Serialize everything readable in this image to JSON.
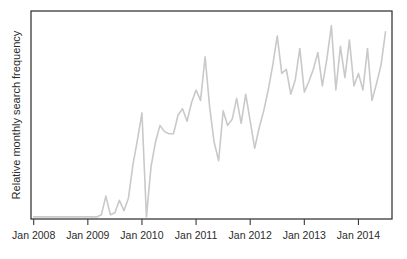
{
  "chart_data": {
    "type": "line",
    "title": "",
    "xlabel": "",
    "ylabel": "Relative monthly search frequency",
    "grid": false,
    "legend": false,
    "x_tick_labels": [
      "Jan 2008",
      "Jan 2009",
      "Jan 2010",
      "Jan 2011",
      "Jan 2012",
      "Jan 2013",
      "Jan 2014"
    ],
    "x_tick_values": [
      2008.0,
      2009.0,
      2010.0,
      2011.0,
      2012.0,
      2013.0,
      2014.0
    ],
    "xlim": [
      2007.95,
      2014.62
    ],
    "ylim": [
      0,
      100
    ],
    "y_tick_labels": [],
    "line_color": "#c9c9c9",
    "frame_color": "#3a3a3a",
    "background_color": "#ffffff",
    "series": [
      {
        "name": "Relative monthly search frequency",
        "x": [
          2008.0,
          2008.083,
          2008.167,
          2008.25,
          2008.333,
          2008.417,
          2008.5,
          2008.583,
          2008.667,
          2008.75,
          2008.833,
          2008.917,
          2009.0,
          2009.083,
          2009.167,
          2009.25,
          2009.333,
          2009.417,
          2009.5,
          2009.583,
          2009.667,
          2009.75,
          2009.833,
          2009.917,
          2010.0,
          2010.083,
          2010.167,
          2010.25,
          2010.333,
          2010.417,
          2010.5,
          2010.583,
          2010.667,
          2010.75,
          2010.833,
          2010.917,
          2011.0,
          2011.083,
          2011.167,
          2011.25,
          2011.333,
          2011.417,
          2011.5,
          2011.583,
          2011.667,
          2011.75,
          2011.833,
          2011.917,
          2012.0,
          2012.083,
          2012.167,
          2012.25,
          2012.333,
          2012.417,
          2012.5,
          2012.583,
          2012.667,
          2012.75,
          2012.833,
          2012.917,
          2013.0,
          2013.083,
          2013.167,
          2013.25,
          2013.333,
          2013.417,
          2013.5,
          2013.583,
          2013.667,
          2013.75,
          2013.833,
          2013.917,
          2014.0,
          2014.083,
          2014.167,
          2014.25,
          2014.333,
          2014.417,
          2014.5
        ],
        "values": [
          1,
          1,
          1,
          1,
          1,
          1,
          1,
          1,
          1,
          1,
          1,
          1,
          1,
          1,
          1,
          2,
          11,
          2,
          3,
          9,
          4,
          10,
          26,
          38,
          51,
          1,
          25,
          37,
          45,
          42,
          41,
          41,
          50,
          53,
          47,
          56,
          62,
          57,
          78,
          54,
          37,
          28,
          52,
          45,
          48,
          58,
          46,
          60,
          47,
          34,
          44,
          52,
          62,
          74,
          88,
          70,
          72,
          60,
          67,
          82,
          61,
          66,
          72,
          80,
          64,
          77,
          93,
          62,
          83,
          68,
          86,
          64,
          70,
          62,
          82,
          57,
          65,
          74,
          90
        ]
      }
    ]
  }
}
